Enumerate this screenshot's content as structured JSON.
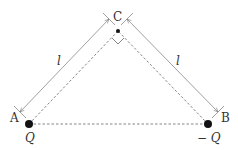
{
  "diagram": {
    "points": {
      "A": {
        "label": "A",
        "charge_label": "Q"
      },
      "B": {
        "label": "B",
        "charge_label": "− Q"
      },
      "C": {
        "label": "C"
      }
    },
    "dimensions": {
      "AC_length": "l",
      "BC_length": "l"
    },
    "annotations": {
      "right_angle_at": "C"
    },
    "colors": {
      "line": "#888888",
      "dashed": "#555555",
      "charge": "#111111",
      "text": "#333333"
    }
  }
}
